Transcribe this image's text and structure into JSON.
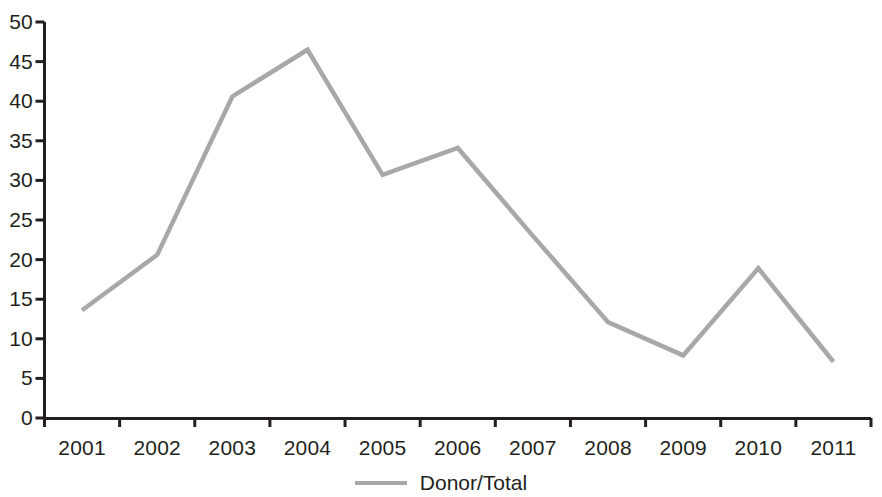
{
  "chart_data": {
    "type": "line",
    "title": "",
    "xlabel": "",
    "ylabel": "",
    "categories": [
      "2001",
      "2002",
      "2003",
      "2004",
      "2005",
      "2006",
      "2007",
      "2008",
      "2009",
      "2010",
      "2011"
    ],
    "series": [
      {
        "name": "Donor/Total",
        "color": "#a8a8a8",
        "values": [
          13.6,
          20.6,
          40.6,
          46.5,
          30.7,
          34.1,
          23.0,
          12.1,
          7.9,
          18.9,
          7.1
        ]
      }
    ],
    "ylim": [
      0,
      50
    ],
    "ytick_values": [
      0,
      5,
      10,
      15,
      20,
      25,
      30,
      35,
      40,
      45,
      50
    ],
    "ytick_labels": [
      "0",
      "5",
      "10",
      "15",
      "20",
      "25",
      "30",
      "35",
      "40",
      "45",
      "50"
    ],
    "grid": false,
    "legend": {
      "position": "bottom-center",
      "entries": [
        {
          "label": "Donor/Total",
          "marker": "line-swatch",
          "color": "#a8a8a8"
        }
      ]
    },
    "axis_color": "#231f20",
    "background": "#ffffff"
  }
}
